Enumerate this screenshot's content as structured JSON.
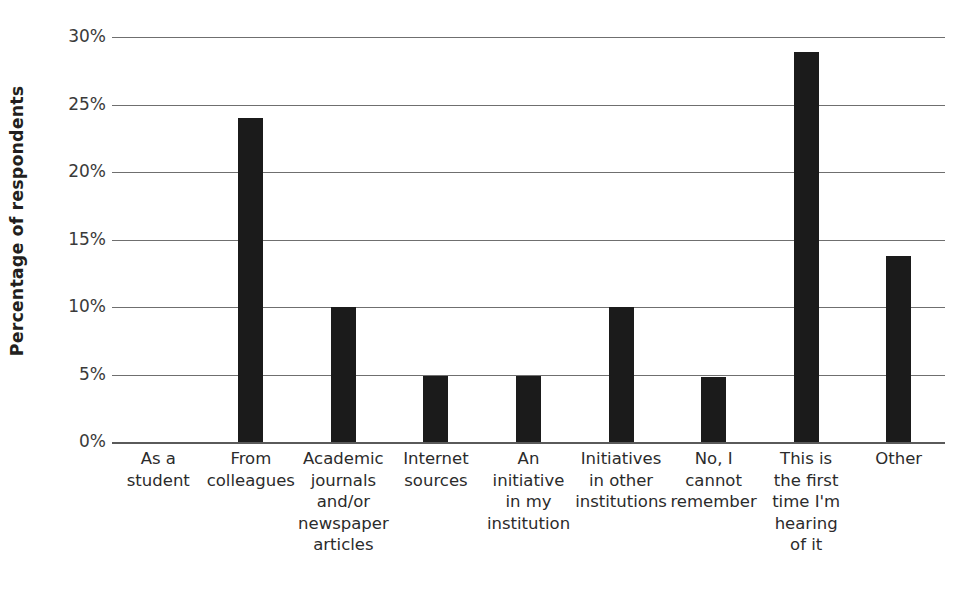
{
  "chart_data": {
    "type": "bar",
    "title": "",
    "subtitle": "",
    "xlabel": "",
    "ylabel": "Percentage of respondents",
    "ylim": [
      0,
      30
    ],
    "ytick_labels": [
      "30%",
      "25%",
      "20%",
      "15%",
      "10%",
      "5%",
      "0%"
    ],
    "ytick_values": [
      30,
      25,
      20,
      15,
      10,
      5,
      0
    ],
    "grid": true,
    "legend": "none",
    "bar_color": "#1b1b1b",
    "gridline_color": "#6f6f6f",
    "categories": [
      "As a student",
      "From colleagues",
      "Academic journals and/or newspaper articles",
      "Internet sources",
      "An initiative in my institution",
      "Initiatives in other institutions",
      "No, I cannot remember",
      "This is the first time I'm hearing of it",
      "Other"
    ],
    "category_lines": [
      [
        "As a",
        "student"
      ],
      [
        "From",
        "colleagues"
      ],
      [
        "Academic",
        "journals",
        "and/or",
        "newspaper",
        "articles"
      ],
      [
        "Internet",
        "sources"
      ],
      [
        "An",
        "initiative",
        "in my",
        "institution"
      ],
      [
        "Initiatives",
        "in other",
        "institutions"
      ],
      [
        "No, I",
        "cannot",
        "remember"
      ],
      [
        "This is",
        "the first",
        "time I'm",
        "hearing",
        "of it"
      ],
      [
        "Other"
      ]
    ],
    "values": [
      0,
      24.0,
      10.0,
      4.9,
      4.9,
      10.0,
      4.85,
      28.9,
      13.8
    ],
    "value_labels": [
      "0%",
      "24%",
      "10%",
      "4.9%",
      "4.9%",
      "10%",
      "4.9%",
      "28.9%",
      "13.8%"
    ]
  }
}
